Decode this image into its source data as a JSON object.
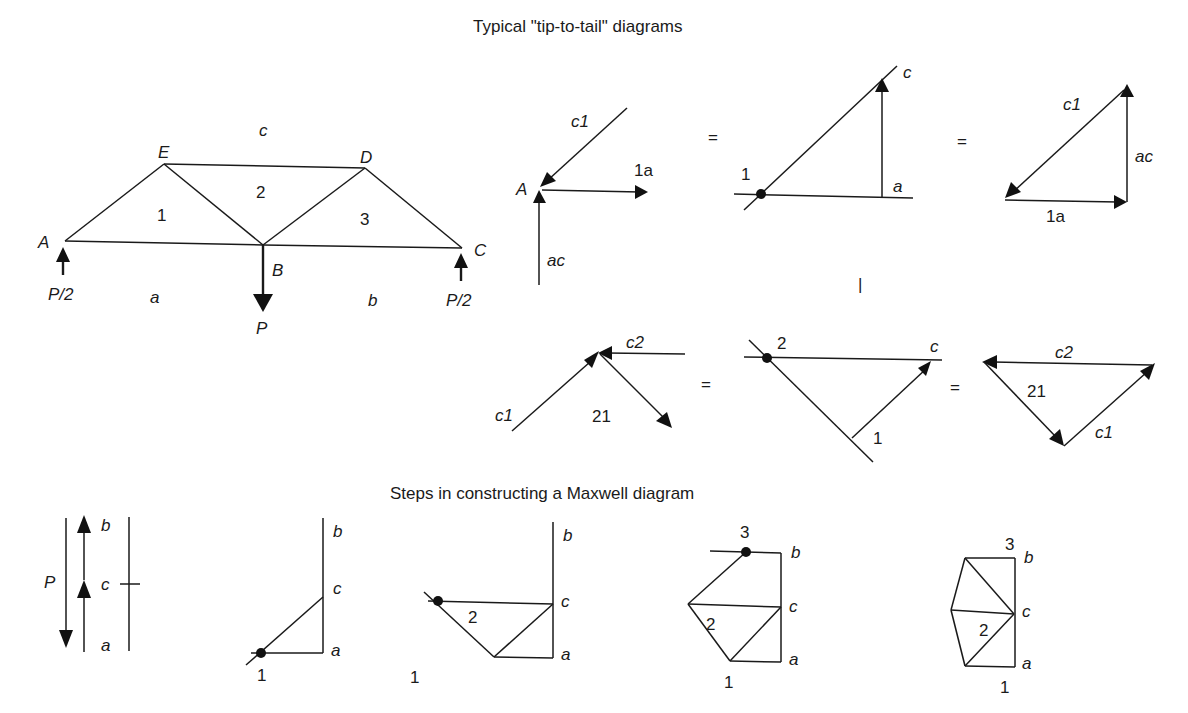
{
  "titles": {
    "top": "Typical \"tip-to-tail\" diagrams",
    "bottom": "Steps in constructing a Maxwell diagram"
  },
  "truss": {
    "nodes": {
      "A": "A",
      "B": "B",
      "C": "C",
      "D": "D",
      "E": "E"
    },
    "regions": {
      "c": "c",
      "one": "1",
      "two": "2",
      "three": "3",
      "a": "a",
      "b": "b"
    },
    "loads": {
      "left": "P/2",
      "right": "P/2",
      "center": "P"
    }
  },
  "tip_to_tail_1": {
    "vectors": {
      "c1": "c1",
      "one_a": "1a",
      "ac": "ac",
      "joint": "A"
    },
    "equals1": "=",
    "mid": {
      "point": "1",
      "c": "c",
      "a": "a"
    },
    "equals2": "=",
    "triangle": {
      "c1": "c1",
      "ac": "ac",
      "one_a": "1a"
    },
    "separator": "|"
  },
  "tip_to_tail_2": {
    "vectors": {
      "c2": "c2",
      "c1": "c1",
      "twenty_one": "21"
    },
    "equals1": "=",
    "mid": {
      "point2": "2",
      "c": "c",
      "point1": "1"
    },
    "equals2": "=",
    "triangle": {
      "c2": "c2",
      "twenty_one": "21",
      "c1": "c1"
    }
  },
  "maxwell_steps": {
    "load_line": {
      "P": "P",
      "b": "b",
      "c": "c",
      "a": "a"
    },
    "step1": {
      "b": "b",
      "c": "c",
      "a": "a",
      "one": "1"
    },
    "step2": {
      "b": "b",
      "c": "c",
      "a": "a",
      "one": "1",
      "two": "2"
    },
    "step3": {
      "b": "b",
      "c": "c",
      "a": "a",
      "one": "1",
      "two": "2",
      "three": "3"
    },
    "step4": {
      "b": "b",
      "c": "c",
      "a": "a",
      "one": "1",
      "two": "2",
      "three": "3"
    }
  }
}
